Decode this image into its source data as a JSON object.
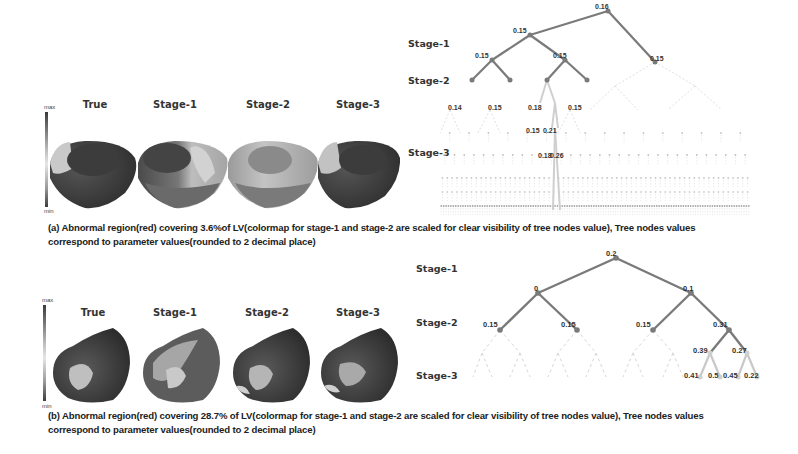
{
  "panel_a": {
    "column_titles": [
      "True",
      "Stage-1",
      "Stage-2",
      "Stage-3"
    ],
    "colorbar": {
      "max_label": "max",
      "min_label": "min"
    },
    "stage_labels": [
      "Stage-1",
      "Stage-2",
      "Stage-3"
    ],
    "tree_nodes": {
      "root": "0.16",
      "level1": [
        "0.15",
        "0.15"
      ],
      "level2": [
        "0.15",
        "0.15"
      ],
      "level3": [
        "0.14",
        "0.15",
        "0.18",
        "0.15"
      ],
      "level4": [
        "0.15",
        "0.21"
      ],
      "level5": [
        "0.18",
        "0.26"
      ]
    },
    "caption_line1": "(a) Abnormal region(red) covering 3.6%of LV(colormap for stage-1 and stage-2 are scaled for clear visibility of tree nodes value), Tree nodes values",
    "caption_line2": "correspond to parameter values(rounded to 2 decimal place)"
  },
  "panel_b": {
    "column_titles": [
      "True",
      "Stage-1",
      "Stage-2",
      "Stage-3"
    ],
    "colorbar": {
      "max_label": "max",
      "min_label": "min"
    },
    "stage_labels": [
      "Stage-1",
      "Stage-2",
      "Stage-3"
    ],
    "tree_nodes": {
      "root": "0.2",
      "level1": [
        "0",
        "0.1"
      ],
      "level2": [
        "0.15",
        "0.15",
        "0.15",
        "0.31"
      ],
      "level3": [
        "0.39",
        "0.27"
      ],
      "level4": [
        "0.41",
        "0.5",
        "0.45",
        "0.22"
      ]
    },
    "caption_line1": "(b) Abnormal region(red) covering 28.7% of LV(colormap for stage-1 and stage-2 are scaled for clear visibility of tree nodes value), Tree nodes values",
    "caption_line2": "correspond to parameter values(rounded to 2 decimal place)"
  },
  "colors": {
    "active_edge": "#7a7a7a",
    "inactive_edge": "#d0d0d0",
    "highlight_edge": "#c8c8c8",
    "heart_dark": "#3a3a3a",
    "heart_light": "#cfcfcf"
  }
}
